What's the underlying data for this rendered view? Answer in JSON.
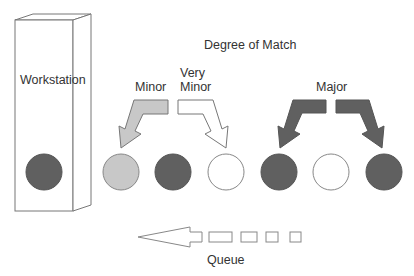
{
  "title": "Degree of Match",
  "workstation": {
    "label": "Workstation",
    "ball_color": "#606060"
  },
  "arrows": [
    {
      "label": "Minor",
      "fill": "#c8c8c8"
    },
    {
      "label_line1": "Very",
      "label_line2": "Minor",
      "fill": "#ffffff"
    },
    {
      "label": "Major",
      "fill": "#606060"
    }
  ],
  "queue_items": [
    {
      "type": "light",
      "fill": "#c8c8c8"
    },
    {
      "type": "dark",
      "fill": "#606060"
    },
    {
      "type": "empty",
      "fill": "#ffffff"
    },
    {
      "type": "dark",
      "fill": "#606060"
    },
    {
      "type": "empty",
      "fill": "#ffffff"
    },
    {
      "type": "dark",
      "fill": "#606060"
    }
  ],
  "queue": {
    "label": "Queue"
  }
}
